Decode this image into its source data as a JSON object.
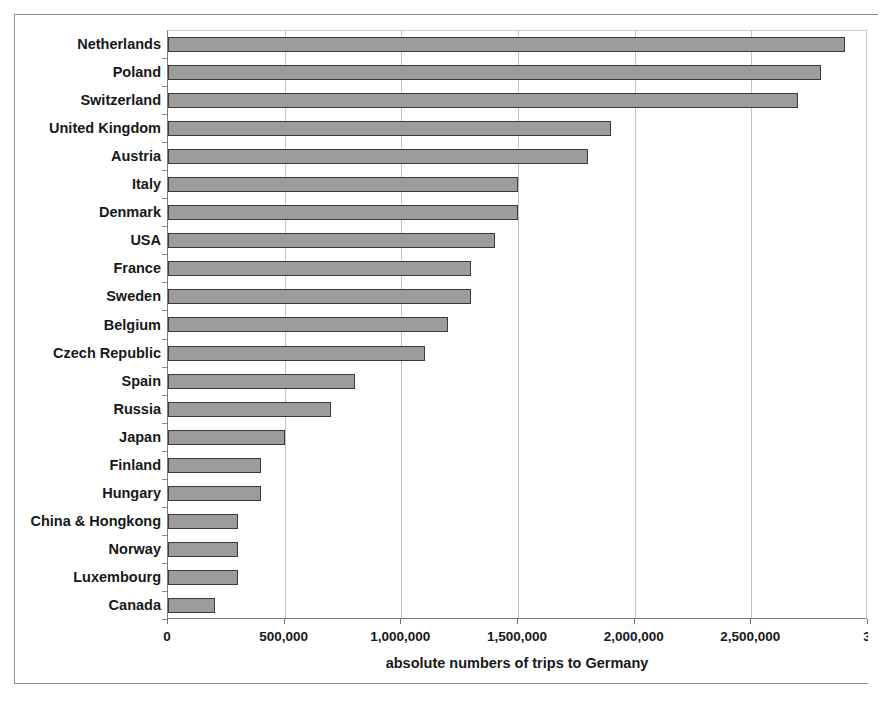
{
  "chart_data": {
    "type": "bar",
    "orientation": "horizontal",
    "title": "",
    "xlabel": "absolute numbers of trips to Germany",
    "ylabel": "",
    "xlim": [
      0,
      3000000
    ],
    "xticks": [
      0,
      500000,
      1000000,
      1500000,
      2000000,
      2500000,
      3000000
    ],
    "xtick_labels": [
      "0",
      "500,000",
      "1,000,000",
      "1,500,000",
      "2,000,000",
      "2,500,000",
      "3"
    ],
    "grid": "vertical",
    "legend": "none",
    "bar_color": "#9c9c9c",
    "bar_edge_color": "#3a3a3a",
    "categories": [
      "Netherlands",
      "Poland",
      "Switzerland",
      "United Kingdom",
      "Austria",
      "Italy",
      "Denmark",
      "USA",
      "France",
      "Sweden",
      "Belgium",
      "Czech Republic",
      "Spain",
      "Russia",
      "Japan",
      "Finland",
      "Hungary",
      "China & Hongkong",
      "Norway",
      "Luxembourg",
      "Canada"
    ],
    "values": [
      2900000,
      2800000,
      2700000,
      1900000,
      1800000,
      1500000,
      1500000,
      1400000,
      1300000,
      1300000,
      1200000,
      1100000,
      800000,
      700000,
      500000,
      400000,
      400000,
      300000,
      300000,
      300000,
      200000
    ]
  }
}
